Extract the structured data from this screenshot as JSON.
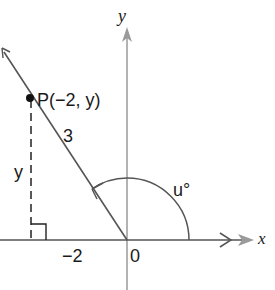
{
  "diagram": {
    "type": "coordinate-angle",
    "axes": {
      "x_label": "x",
      "y_label": "y",
      "origin_label": "0",
      "axis_color": "#8a8a8a"
    },
    "point": {
      "label": "P(−2, y)",
      "x": -2,
      "y": "y"
    },
    "terminal_side": {
      "length_label": "3",
      "color": "#555555"
    },
    "vertical_segment": {
      "label": "y",
      "style": "dashed"
    },
    "x_tick_label": "−2",
    "angle": {
      "label": "u°",
      "direction": "counterclockwise"
    },
    "right_angle_marker": true
  }
}
